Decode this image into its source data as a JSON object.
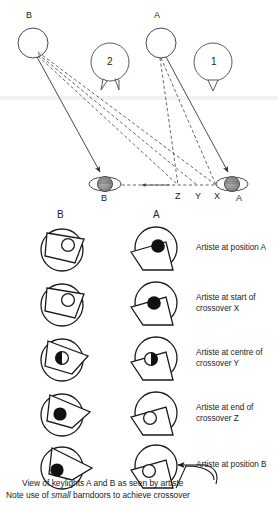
{
  "figure": {
    "title_top": "Lighting plan: keylights A and B with crossover",
    "top_diagram": {
      "lamp_labels": [
        {
          "id": "lamp-b",
          "label": "B",
          "x": 26,
          "y": 14
        },
        {
          "id": "lamp-a",
          "label": "A",
          "x": 152,
          "y": 14
        }
      ],
      "fixture_symbols": [
        {
          "id": "fixture-2",
          "label": "2",
          "cx": 110,
          "cy": 62,
          "flaps": 2
        },
        {
          "id": "fixture-1",
          "label": "1",
          "cx": 213,
          "cy": 62,
          "flaps": 1
        }
      ],
      "head_labels": [
        {
          "id": "head-b",
          "label": "B",
          "x": 101,
          "y": 196
        },
        {
          "id": "head-a",
          "label": "A",
          "x": 236,
          "y": 196
        }
      ],
      "crossover_points": [
        {
          "id": "point-z",
          "label": "Z",
          "x": 177,
          "y": 194
        },
        {
          "id": "point-y",
          "label": "Y",
          "x": 197,
          "y": 194
        },
        {
          "id": "point-x",
          "label": "X",
          "x": 216,
          "y": 194
        }
      ]
    },
    "bottom_diagram": {
      "column_headers": [
        {
          "id": "col-b",
          "label": "B",
          "x": 58,
          "y": 210
        },
        {
          "id": "col-a",
          "label": "A",
          "x": 154,
          "y": 210
        }
      ],
      "rows": [
        {
          "caption": "Artiste at position A",
          "b_bulb": "hollow",
          "a_bulb": "filled"
        },
        {
          "caption": "Artiste at start of",
          "caption2": "crossover X",
          "b_bulb": "hollow",
          "a_bulb": "filled"
        },
        {
          "caption": "Artiste at centre of",
          "caption2": "crossover Y",
          "b_bulb": "half",
          "a_bulb": "half"
        },
        {
          "caption": "Artiste at end of",
          "caption2": "crossover Z",
          "b_bulb": "filled",
          "a_bulb": "hollow"
        },
        {
          "caption": "Artiste at position B",
          "b_bulb": "filled",
          "a_bulb": "hollow"
        }
      ]
    },
    "notes": {
      "line1": "View of keylights A and B as seen by artiste",
      "line2_prefix": "Note use of ",
      "line2_emph": "small",
      "line2_suffix": " barndoors to achieve crossover"
    },
    "colors": {
      "ink": "#1a1a1a",
      "line": "#3a3a3a",
      "dashed": "#4a4a4a",
      "head_fill": "#8f8f8f",
      "paper": "#ffffff"
    }
  }
}
